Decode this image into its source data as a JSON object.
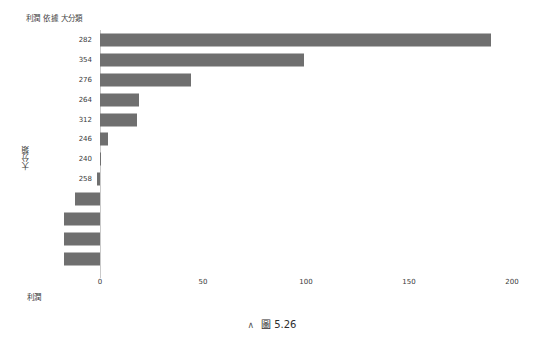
{
  "chart_data": {
    "type": "bar",
    "orientation": "horizontal",
    "title": "利潤 依據 大分類",
    "xlabel": "利潤",
    "ylabel": "大分類",
    "xlim": [
      -20,
      200
    ],
    "xticks": [
      0,
      50,
      100,
      150,
      200
    ],
    "xticklabels": [
      "0",
      "50",
      "100",
      "150",
      "200"
    ],
    "grid": false,
    "legend": null,
    "bar_color": "#6f6f6f",
    "categories": [
      "282",
      "354",
      "276",
      "264",
      "312",
      "246",
      "240",
      "258",
      "270",
      "252",
      "318",
      "360"
    ],
    "values": [
      190,
      99,
      44,
      19,
      18,
      4,
      0.5,
      -1.5,
      -12,
      -17.5,
      -17.5,
      -17.5
    ],
    "points": [
      {
        "category": "282",
        "value": 190
      },
      {
        "category": "354",
        "value": 99
      },
      {
        "category": "276",
        "value": 44
      },
      {
        "category": "264",
        "value": 19
      },
      {
        "category": "312",
        "value": 18
      },
      {
        "category": "246",
        "value": 4
      },
      {
        "category": "240",
        "value": 0.5
      },
      {
        "category": "258",
        "value": -1.5
      },
      {
        "category": "270",
        "value": -12
      },
      {
        "category": "252",
        "value": -17.5
      },
      {
        "category": "318",
        "value": -17.5
      },
      {
        "category": "360",
        "value": -17.5
      }
    ]
  },
  "caption": {
    "caret": "∧",
    "figure_word": "圖",
    "number": "5.26"
  }
}
